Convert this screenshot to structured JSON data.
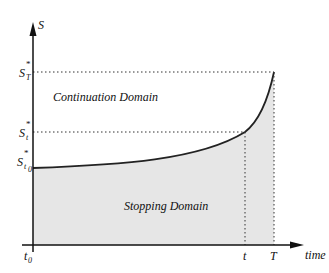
{
  "diagram": {
    "y_axis_label": "S",
    "x_axis_label": "time",
    "y_ticks": [
      {
        "main": "S",
        "sup": "*",
        "sub": "T"
      },
      {
        "main": "S",
        "sup": "*",
        "sub": "t"
      },
      {
        "main": "S",
        "sup": "*",
        "sub": "t",
        "subsub": "0"
      }
    ],
    "x_ticks": [
      {
        "main": "t",
        "sub": "0"
      },
      {
        "main": "t"
      },
      {
        "main": "T"
      }
    ],
    "regions": {
      "upper": "Continuation Domain",
      "lower": "Stopping Domain"
    },
    "colors": {
      "shade": "#e6e6e6",
      "curve": "#222222",
      "axis": "#111111"
    }
  }
}
